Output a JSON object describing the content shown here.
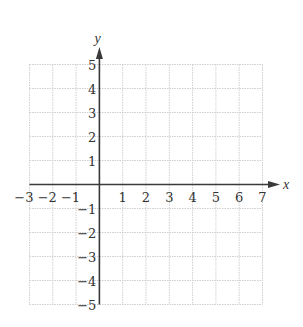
{
  "chart_data": {
    "type": "coordinate-grid",
    "title": "",
    "xlabel": "x",
    "ylabel": "y",
    "xlim": [
      -3,
      7
    ],
    "ylim": [
      -5,
      5
    ],
    "grid": true,
    "grid_style": "dotted",
    "x_ticks": [
      "−3",
      "−2",
      "−1",
      "1",
      "2",
      "3",
      "4",
      "5",
      "6",
      "7"
    ],
    "y_ticks": [
      "5",
      "4",
      "3",
      "2",
      "1",
      "−1",
      "−2",
      "−3",
      "−4",
      "−5"
    ],
    "series": []
  },
  "axes": {
    "x_label": "x",
    "y_label": "y"
  },
  "colors": {
    "axis": "#3a3a3a",
    "grid": "#cfcfcf",
    "text": "#333333"
  }
}
